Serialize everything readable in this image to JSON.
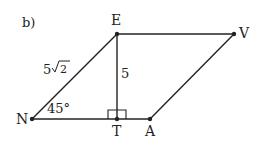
{
  "figure": {
    "label": "b)",
    "points": {
      "E": {
        "label": "E",
        "x": 117,
        "y": 34
      },
      "V": {
        "label": "V",
        "x": 234,
        "y": 34
      },
      "N": {
        "label": "N",
        "x": 32,
        "y": 119
      },
      "T": {
        "label": "T",
        "x": 117,
        "y": 119
      },
      "A": {
        "label": "A",
        "x": 150,
        "y": 119
      }
    },
    "measurements": {
      "side_NE": "5",
      "side_NE_radical": "2",
      "height_ET": "5",
      "angle_N": "45°"
    },
    "line_color": "#222222"
  }
}
